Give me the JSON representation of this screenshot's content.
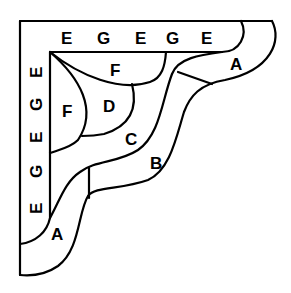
{
  "diagram": {
    "type": "corner-bracket-region-labels",
    "colors": {
      "stroke": "#000000",
      "background": "#ffffff"
    },
    "top_band_letters": [
      "E",
      "G",
      "E",
      "G",
      "E"
    ],
    "left_band_letters": [
      "E",
      "G",
      "E",
      "G",
      "E"
    ],
    "regions": {
      "f_top": "F",
      "f_left": "F",
      "d": "D",
      "c": "C",
      "b": "B",
      "a_right": "A",
      "a_left": "A"
    }
  }
}
